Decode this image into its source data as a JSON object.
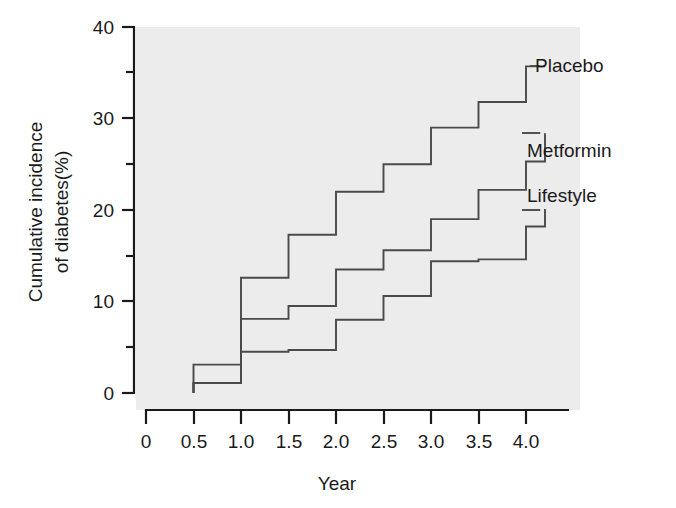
{
  "chart_data": {
    "type": "line",
    "subtype": "step",
    "title": "",
    "xlabel": "Year",
    "ylabel": "Cumulative incidence of diabetes(%)",
    "ylabel_lines": [
      "Cumulative incidence",
      "of diabetes(%)"
    ],
    "xlim": [
      0,
      4.4
    ],
    "ylim": [
      0,
      40
    ],
    "x_ticks": [
      0,
      0.5,
      1.0,
      1.5,
      2.0,
      2.5,
      3.0,
      3.5,
      4.0
    ],
    "x_tick_labels": [
      "0",
      "0.5",
      "1.0",
      "1.5",
      "2.0",
      "2.5",
      "3.0",
      "3.5",
      "4.0"
    ],
    "y_ticks": [
      0,
      10,
      20,
      30,
      40
    ],
    "y_tick_labels": [
      "0",
      "10",
      "20",
      "30",
      "40"
    ],
    "y_minor_ticks": [
      5,
      15,
      25,
      35
    ],
    "grid": false,
    "legend_position": "right-inline-annotations",
    "x": [
      0.5,
      1.0,
      1.5,
      2.0,
      2.5,
      3.0,
      3.5,
      4.0,
      4.2
    ],
    "series": [
      {
        "name": "Placebo",
        "color": "#4a4a4a",
        "values": [
          3.1,
          12.6,
          17.3,
          22.0,
          25.0,
          29.0,
          31.8,
          35.7,
          35.7
        ],
        "label_anchor": {
          "x": 4.15,
          "y": 35.7
        }
      },
      {
        "name": "Metformin",
        "color": "#4a4a4a",
        "values": [
          1.1,
          8.1,
          9.5,
          13.5,
          15.6,
          19.0,
          22.2,
          25.3,
          28.4
        ],
        "label_anchor": {
          "x": 4.15,
          "y": 28.4
        }
      },
      {
        "name": "Lifestyle",
        "color": "#4a4a4a",
        "values": [
          1.1,
          4.5,
          4.7,
          8.0,
          10.6,
          14.4,
          14.6,
          18.2,
          20.1
        ],
        "label_anchor": {
          "x": 4.15,
          "y": 20.1
        }
      }
    ]
  },
  "axes": {
    "x_axis_name": "Year",
    "y_axis_name": "Cumulative incidence of diabetes(%)"
  }
}
